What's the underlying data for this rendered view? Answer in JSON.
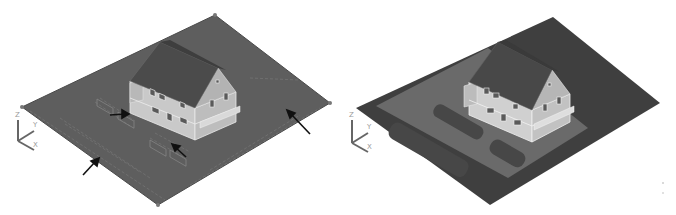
{
  "figure": {
    "panels": [
      {
        "id": "left",
        "description": "Wireframe terrain plot with house model, arrows indicating boundary edges and paving areas",
        "ucs_icon": {
          "labels": [
            "Z",
            "Y",
            "X"
          ]
        },
        "arrows_count": 4,
        "colors": {
          "terrain": "#5e5e5e",
          "house_wall": "#cfcfcf",
          "roof": "#4a4a4a",
          "arrow": "#111111"
        }
      },
      {
        "id": "right",
        "description": "Shaded terrain plot with house model and darker paved parking areas",
        "ucs_icon": {
          "labels": [
            "Z",
            "Y",
            "X"
          ]
        },
        "colors": {
          "terrain_outer": "#3f3f3f",
          "terrain_inner": "#6a6a6a",
          "paving": "#474747",
          "house_wall": "#d4d4d4",
          "roof": "#454545"
        }
      }
    ]
  }
}
